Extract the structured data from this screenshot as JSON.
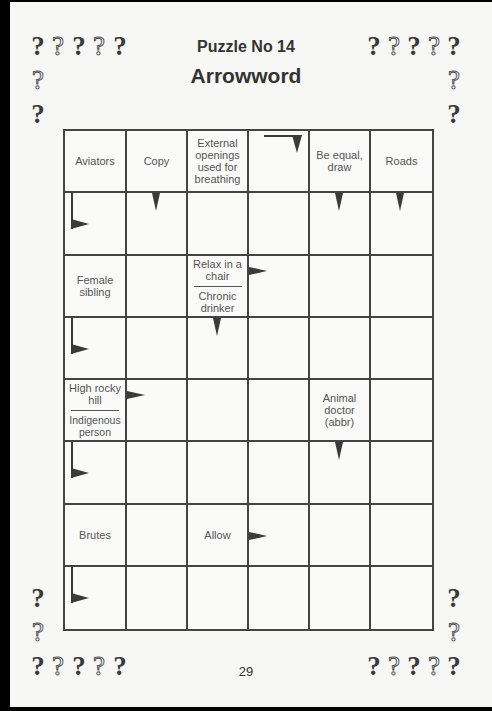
{
  "header": {
    "puzzle_number": "Puzzle No 14",
    "title": "Arrowword"
  },
  "footer": {
    "page_number": "29"
  },
  "decorations": {
    "question_mark_glyph": "?",
    "colors": {
      "solid": "#3a3a3a",
      "outline_stroke": "#555555",
      "grid_line": "#444444",
      "page": "#f7f7f5"
    }
  },
  "grid": {
    "columns": 6,
    "rows": 8,
    "cells": [
      {
        "row": 1,
        "col": 1,
        "type": "clue",
        "clues": [
          "Aviators"
        ]
      },
      {
        "row": 1,
        "col": 2,
        "type": "clue",
        "clues": [
          "Copy"
        ]
      },
      {
        "row": 1,
        "col": 3,
        "type": "clue",
        "clues": [
          "External openings used for breathing"
        ]
      },
      {
        "row": 1,
        "col": 4,
        "type": "answer",
        "arrow": "right-then-down"
      },
      {
        "row": 1,
        "col": 5,
        "type": "clue",
        "clues": [
          "Be equal, draw"
        ]
      },
      {
        "row": 1,
        "col": 6,
        "type": "clue",
        "clues": [
          "Roads"
        ]
      },
      {
        "row": 2,
        "col": 1,
        "type": "answer",
        "arrow": "down-then-right"
      },
      {
        "row": 2,
        "col": 2,
        "type": "answer",
        "arrow": "down"
      },
      {
        "row": 2,
        "col": 3,
        "type": "answer"
      },
      {
        "row": 2,
        "col": 4,
        "type": "answer"
      },
      {
        "row": 2,
        "col": 5,
        "type": "answer",
        "arrow": "down"
      },
      {
        "row": 2,
        "col": 6,
        "type": "answer",
        "arrow": "down"
      },
      {
        "row": 3,
        "col": 1,
        "type": "clue",
        "clues": [
          "Female sibling"
        ]
      },
      {
        "row": 3,
        "col": 2,
        "type": "answer"
      },
      {
        "row": 3,
        "col": 3,
        "type": "clue",
        "clues": [
          "Relax in a chair",
          "Chronic drinker"
        ]
      },
      {
        "row": 3,
        "col": 4,
        "type": "answer",
        "arrow": "right"
      },
      {
        "row": 3,
        "col": 5,
        "type": "answer"
      },
      {
        "row": 3,
        "col": 6,
        "type": "answer"
      },
      {
        "row": 4,
        "col": 1,
        "type": "answer",
        "arrow": "down-then-right"
      },
      {
        "row": 4,
        "col": 2,
        "type": "answer"
      },
      {
        "row": 4,
        "col": 3,
        "type": "answer",
        "arrow": "down"
      },
      {
        "row": 4,
        "col": 4,
        "type": "answer"
      },
      {
        "row": 4,
        "col": 5,
        "type": "answer"
      },
      {
        "row": 4,
        "col": 6,
        "type": "answer"
      },
      {
        "row": 5,
        "col": 1,
        "type": "clue",
        "clues": [
          "High rocky hill",
          "Indigenous person"
        ]
      },
      {
        "row": 5,
        "col": 2,
        "type": "answer",
        "arrow": "right"
      },
      {
        "row": 5,
        "col": 3,
        "type": "answer"
      },
      {
        "row": 5,
        "col": 4,
        "type": "answer"
      },
      {
        "row": 5,
        "col": 5,
        "type": "clue",
        "clues": [
          "Animal doctor (abbr)"
        ]
      },
      {
        "row": 5,
        "col": 6,
        "type": "answer"
      },
      {
        "row": 6,
        "col": 1,
        "type": "answer",
        "arrow": "down-then-right"
      },
      {
        "row": 6,
        "col": 2,
        "type": "answer"
      },
      {
        "row": 6,
        "col": 3,
        "type": "answer"
      },
      {
        "row": 6,
        "col": 4,
        "type": "answer"
      },
      {
        "row": 6,
        "col": 5,
        "type": "answer",
        "arrow": "down"
      },
      {
        "row": 6,
        "col": 6,
        "type": "answer"
      },
      {
        "row": 7,
        "col": 1,
        "type": "clue",
        "clues": [
          "Brutes"
        ]
      },
      {
        "row": 7,
        "col": 2,
        "type": "answer"
      },
      {
        "row": 7,
        "col": 3,
        "type": "clue",
        "clues": [
          "Allow"
        ]
      },
      {
        "row": 7,
        "col": 4,
        "type": "answer",
        "arrow": "right"
      },
      {
        "row": 7,
        "col": 5,
        "type": "answer"
      },
      {
        "row": 7,
        "col": 6,
        "type": "answer"
      },
      {
        "row": 8,
        "col": 1,
        "type": "answer",
        "arrow": "down-then-right"
      },
      {
        "row": 8,
        "col": 2,
        "type": "answer"
      },
      {
        "row": 8,
        "col": 3,
        "type": "answer"
      },
      {
        "row": 8,
        "col": 4,
        "type": "answer"
      },
      {
        "row": 8,
        "col": 5,
        "type": "answer"
      },
      {
        "row": 8,
        "col": 6,
        "type": "answer"
      }
    ]
  }
}
